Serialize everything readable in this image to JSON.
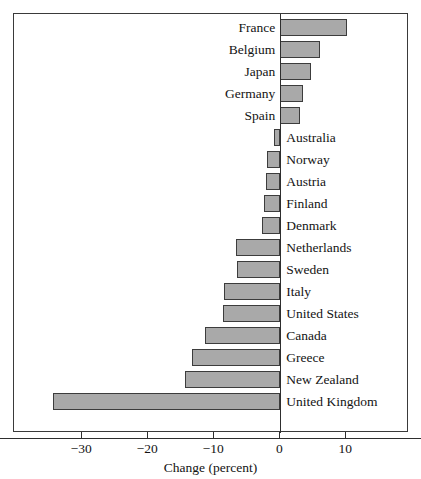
{
  "chart_data": {
    "type": "bar",
    "orientation": "horizontal",
    "title": "",
    "xlabel": "Change (percent)",
    "ylabel": "",
    "xlim": [
      -36.2,
      15.5
    ],
    "xticks": [
      -30,
      -20,
      -10,
      0,
      10
    ],
    "xtick_labels": [
      "−30",
      "−20",
      "−10",
      "0",
      "10"
    ],
    "grid": false,
    "legend": null,
    "zero_reference_line": 0,
    "bar_fill_color": "#a9a9a9",
    "bar_edge_color": "#3c3c3c",
    "frame_color": "#3a3a3a",
    "categories": [
      "France",
      "Belgium",
      "Japan",
      "Germany",
      "Spain",
      "Australia",
      "Norway",
      "Austria",
      "Finland",
      "Denmark",
      "Netherlands",
      "Sweden",
      "Italy",
      "United States",
      "Canada",
      "Greece",
      "New Zealand",
      "United Kingdom"
    ],
    "values": [
      10.1,
      6.0,
      4.6,
      3.5,
      3.0,
      -0.9,
      -2.0,
      -2.2,
      -2.5,
      -2.8,
      -6.7,
      -6.6,
      -8.6,
      -8.7,
      -11.4,
      -13.4,
      -14.5,
      -34.5
    ],
    "bars": [
      {
        "label": "France",
        "value": 10.1,
        "label_side": "left"
      },
      {
        "label": "Belgium",
        "value": 6.0,
        "label_side": "left"
      },
      {
        "label": "Japan",
        "value": 4.6,
        "label_side": "left"
      },
      {
        "label": "Germany",
        "value": 3.5,
        "label_side": "left"
      },
      {
        "label": "Spain",
        "value": 3.0,
        "label_side": "left"
      },
      {
        "label": "Australia",
        "value": -0.9,
        "label_side": "right"
      },
      {
        "label": "Norway",
        "value": -2.0,
        "label_side": "right"
      },
      {
        "label": "Austria",
        "value": -2.2,
        "label_side": "right"
      },
      {
        "label": "Finland",
        "value": -2.5,
        "label_side": "right"
      },
      {
        "label": "Denmark",
        "value": -2.8,
        "label_side": "right"
      },
      {
        "label": "Netherlands",
        "value": -6.7,
        "label_side": "right"
      },
      {
        "label": "Sweden",
        "value": -6.6,
        "label_side": "right"
      },
      {
        "label": "Italy",
        "value": -8.6,
        "label_side": "right"
      },
      {
        "label": "United States",
        "value": -8.7,
        "label_side": "right"
      },
      {
        "label": "Canada",
        "value": -11.4,
        "label_side": "right"
      },
      {
        "label": "Greece",
        "value": -13.4,
        "label_side": "right"
      },
      {
        "label": "New Zealand",
        "value": -14.5,
        "label_side": "right"
      },
      {
        "label": "United Kingdom",
        "value": -34.5,
        "label_side": "right"
      }
    ]
  }
}
